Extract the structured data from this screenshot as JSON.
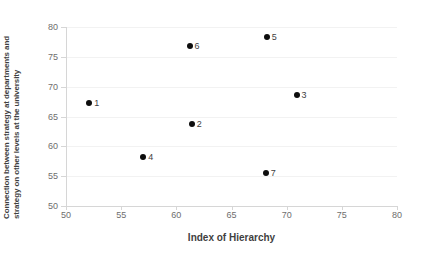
{
  "chart_data": {
    "type": "scatter",
    "title": "",
    "xlabel": "Index of Hierarchy",
    "ylabel_line1": "Connection between strategy at departments and",
    "ylabel_line2": "strategy on other levels at the university",
    "xlim": [
      50,
      80
    ],
    "ylim": [
      50,
      80
    ],
    "xticks": [
      50,
      55,
      60,
      65,
      70,
      75,
      80
    ],
    "yticks": [
      50,
      55,
      60,
      65,
      70,
      75,
      80
    ],
    "grid": "horizontal-faint",
    "legend": "none",
    "point_color": "#0d0d0d",
    "points": [
      {
        "label": "1",
        "x": 52.1,
        "y": 67.3
      },
      {
        "label": "2",
        "x": 61.4,
        "y": 63.7
      },
      {
        "label": "3",
        "x": 70.9,
        "y": 68.6
      },
      {
        "label": "4",
        "x": 57.0,
        "y": 58.2
      },
      {
        "label": "5",
        "x": 68.2,
        "y": 78.3
      },
      {
        "label": "6",
        "x": 61.2,
        "y": 76.8
      },
      {
        "label": "7",
        "x": 68.1,
        "y": 55.6
      }
    ]
  }
}
